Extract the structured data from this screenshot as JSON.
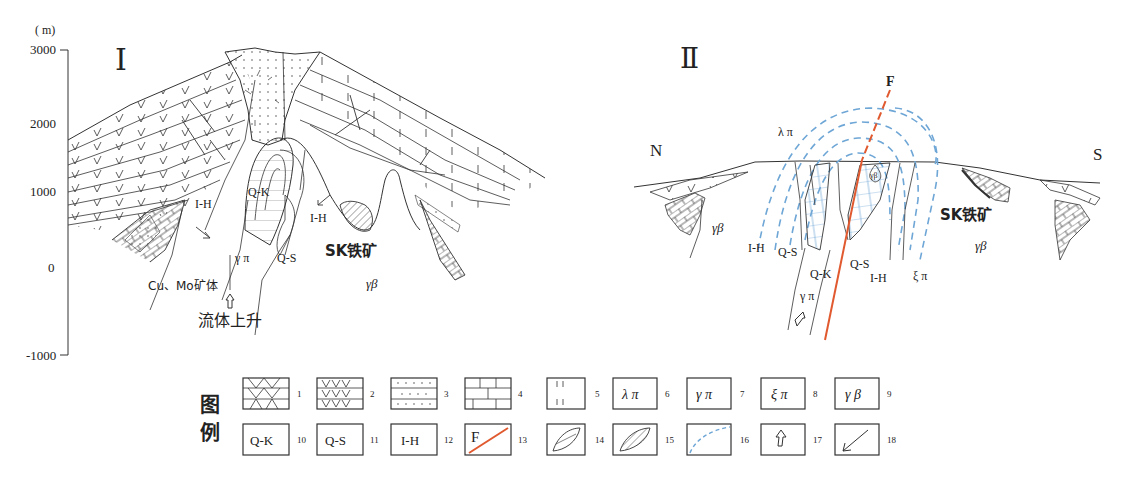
{
  "section1": {
    "title": "Ⅰ",
    "y_axis": {
      "unit": "( m)",
      "ticks": [
        "3000",
        "2000",
        "1000",
        "0",
        "-1000"
      ]
    },
    "labels": {
      "qk": "Q-K",
      "ih_left": "I-H",
      "ih_right": "I-H",
      "qs": "Q-S",
      "gamma_pi": "γ π",
      "sk_iron": "SK铁矿",
      "gamma_beta": "γβ",
      "cu_mo": "Cu、Mo矿体",
      "fluid_rise": "流体上升"
    }
  },
  "section2": {
    "title": "Ⅱ",
    "north": "N",
    "south": "S",
    "fault": "F",
    "labels": {
      "lambda_pi": "λ π",
      "gamma_beta_left": "γβ",
      "gamma_beta_small": "γβ",
      "ih_left": "I-H",
      "qs_left": "Q-S",
      "qk": "Q-K",
      "qs_right": "Q-S",
      "ih_right": "I-H",
      "xi_pi": "ξ π",
      "gamma_pi": "γ π",
      "sk_iron": "SK铁矿",
      "gamma_beta_right": "γβ"
    }
  },
  "legend": {
    "title_line1": "图",
    "title_line2": "例",
    "row1": [
      {
        "num": "1",
        "symbol": "andesite-crosshatch"
      },
      {
        "num": "2",
        "symbol": "v-pattern"
      },
      {
        "num": "3",
        "symbol": "dotted-sandstone"
      },
      {
        "num": "4",
        "symbol": "limestone-brick"
      },
      {
        "num": "5",
        "symbol": "vertical-ticks"
      },
      {
        "num": "6",
        "symbol": "text",
        "text": "λ π"
      },
      {
        "num": "7",
        "symbol": "text",
        "text": "γ π"
      },
      {
        "num": "8",
        "symbol": "text",
        "text": "ξ π"
      },
      {
        "num": "9",
        "symbol": "text",
        "text": "γ β"
      }
    ],
    "row2": [
      {
        "num": "10",
        "symbol": "text",
        "text": "Q-K"
      },
      {
        "num": "11",
        "symbol": "text",
        "text": "Q-S"
      },
      {
        "num": "12",
        "symbol": "text",
        "text": "I-H"
      },
      {
        "num": "13",
        "symbol": "fault",
        "text": "F"
      },
      {
        "num": "14",
        "symbol": "lens"
      },
      {
        "num": "15",
        "symbol": "hatched-lens"
      },
      {
        "num": "16",
        "symbol": "blue-dashed-arc"
      },
      {
        "num": "17",
        "symbol": "up-arrow"
      },
      {
        "num": "18",
        "symbol": "down-left-arrow"
      }
    ]
  },
  "colors": {
    "fault": "#e0592f",
    "isotherm": "#6ea6d6",
    "line": "#333333"
  }
}
